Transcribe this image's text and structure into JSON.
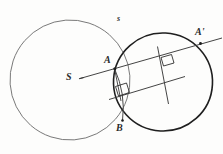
{
  "diagram": {
    "background_color": "#fdfdfc",
    "ink_color": "#3a3a3a",
    "ink_color_dark": "#1d1d1d",
    "labels": {
      "center_left": "S",
      "point_upper_intersection": "A",
      "point_image": "A'",
      "point_lower_intersection": "B",
      "circle_small_label": "s"
    },
    "shapes": {
      "circle_left": {
        "cx": 70,
        "cy": 80,
        "r": 60,
        "stroke": "#6b6b6b",
        "stroke_width": 0.9
      },
      "circle_right": {
        "cx": 163,
        "cy": 82,
        "r": 49,
        "stroke": "#1d1d1d",
        "stroke_width": 1.5
      }
    },
    "lines": {
      "ray_S_to_Aprime": {
        "x1": 80,
        "y1": 78,
        "x2": 221,
        "y2": 38
      },
      "parallel_lower": {
        "x1": 110,
        "y1": 99,
        "x2": 184,
        "y2": 76
      },
      "transversal_steep": {
        "x1": 158,
        "y1": 47,
        "x2": 168,
        "y2": 103
      },
      "chord_A_to_B": {
        "x1": 115,
        "y1": 69,
        "x2": 123,
        "y2": 120
      }
    },
    "right_angle_marks": [
      {
        "name": "right-angle-mark-lower-left",
        "x": 120,
        "y": 88
      },
      {
        "name": "right-angle-mark-upper-right",
        "x": 167,
        "y": 62
      }
    ],
    "points": [
      {
        "name": "point-A",
        "x": 115,
        "y": 69
      },
      {
        "name": "point-A-prime",
        "x": 200,
        "y": 44
      },
      {
        "name": "point-B",
        "x": 123,
        "y": 120
      }
    ]
  }
}
